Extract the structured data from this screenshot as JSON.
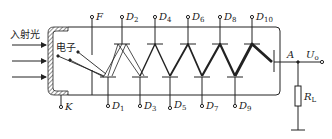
{
  "labels": {
    "incident_light": "入射光",
    "electron": "电子",
    "focus": "F",
    "cathode": "K",
    "anode": "A",
    "output_voltage_main": "U",
    "output_voltage_sub": "o",
    "load_resistor_main": "R",
    "load_resistor_sub": "L"
  },
  "dynodes_top": [
    {
      "main": "D",
      "sub": "2"
    },
    {
      "main": "D",
      "sub": "4"
    },
    {
      "main": "D",
      "sub": "6"
    },
    {
      "main": "D",
      "sub": "8"
    },
    {
      "main": "D",
      "sub": "10"
    }
  ],
  "dynodes_bottom": [
    {
      "main": "D",
      "sub": "1"
    },
    {
      "main": "D",
      "sub": "3"
    },
    {
      "main": "D",
      "sub": "5"
    },
    {
      "main": "D",
      "sub": "7"
    },
    {
      "main": "D",
      "sub": "9"
    }
  ],
  "colors": {
    "stroke": "#222222",
    "background": "#ffffff"
  }
}
